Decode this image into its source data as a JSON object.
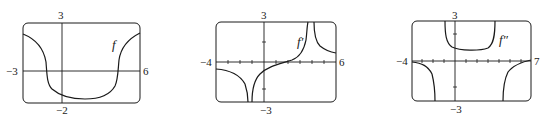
{
  "graphs": [
    {
      "name": "f",
      "label": "f",
      "x_min": "−3",
      "x_max": "6",
      "y_max": "3",
      "y_min": "−2"
    },
    {
      "name": "f-prime",
      "label": "f′",
      "x_min": "−4",
      "x_max": "6",
      "y_max": "3",
      "y_min": "−3"
    },
    {
      "name": "f-double-prime",
      "label": "f″",
      "x_min": "−4",
      "x_max": "7",
      "y_max": "3",
      "y_min": "−3"
    }
  ],
  "colors": {
    "ink": "#1a1a1a",
    "background": "#ffffff"
  }
}
